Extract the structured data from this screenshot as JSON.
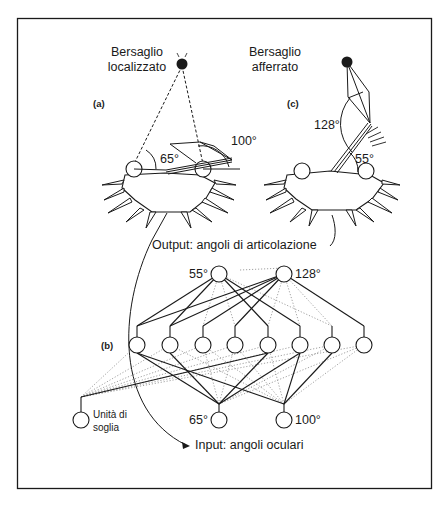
{
  "panel_a": {
    "label": "(a)",
    "target_title_line1": "Bersaglio",
    "target_title_line2": "localizzato",
    "angle_eye_left": "65°",
    "angle_eye_right": "100°"
  },
  "panel_c": {
    "label": "(c)",
    "target_title_line1": "Bersaglio",
    "target_title_line2": "afferrato",
    "angle_elbow": "128°",
    "angle_shoulder": "55°"
  },
  "panel_b": {
    "label": "(b)",
    "output_caption": "Output: angoli di articolazione",
    "input_caption": "Input: angoli oculari",
    "output_nodes": [
      {
        "label": "55°"
      },
      {
        "label": "128°"
      }
    ],
    "input_nodes": [
      {
        "label": "65°"
      },
      {
        "label": "100°"
      }
    ],
    "threshold_unit_line1": "Unità di",
    "threshold_unit_line2": "soglia",
    "hidden_node_count": 8
  },
  "colors": {
    "ink": "#1a1a1a",
    "dotted": "#8a8a8a",
    "background": "#ffffff"
  }
}
